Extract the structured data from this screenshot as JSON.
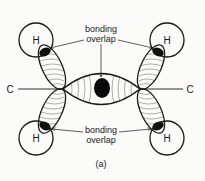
{
  "diagram": {
    "labels": {
      "top_annotation_line1": "bonding",
      "top_annotation_line2": "overlap",
      "bottom_annotation_line1": "bonding",
      "bottom_annotation_line2": "overlap",
      "left_atom": "C",
      "right_atom": "C",
      "h_top_left": "H",
      "h_top_right": "H",
      "h_bottom_left": "H",
      "h_bottom_right": "H",
      "caption": "(a)"
    },
    "colors": {
      "ink": "#1a1a1a",
      "background": "#fbfbfa",
      "hatch": "#777777"
    }
  }
}
